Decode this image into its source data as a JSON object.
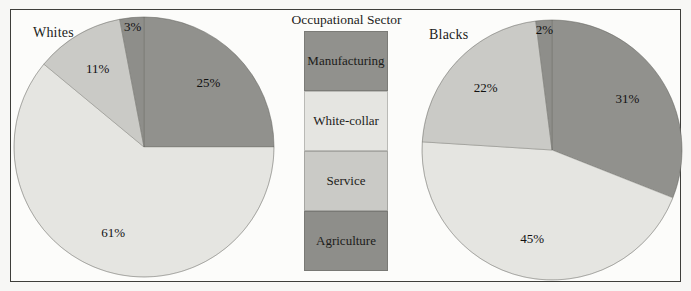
{
  "legend": {
    "title": "Occupational Sector",
    "items": [
      {
        "label": "Manufacturing",
        "color": "#91918d"
      },
      {
        "label": "White-collar",
        "color": "#e5e5e1"
      },
      {
        "label": "Service",
        "color": "#cacac6"
      },
      {
        "label": "Agriculture",
        "color": "#8e8e8a"
      }
    ]
  },
  "chart_data": [
    {
      "type": "pie",
      "title": "Whites",
      "categories": [
        "Manufacturing",
        "White-collar",
        "Service",
        "Agriculture"
      ],
      "values": [
        25,
        61,
        11,
        3
      ],
      "labels": [
        "25%",
        "61%",
        "11%",
        "3%"
      ],
      "start_angle_deg": 0,
      "direction": "clockwise",
      "legend_title": "Occupational Sector"
    },
    {
      "type": "pie",
      "title": "Blacks",
      "categories": [
        "Manufacturing",
        "White-collar",
        "Service",
        "Agriculture"
      ],
      "values": [
        31,
        45,
        22,
        2
      ],
      "labels": [
        "31%",
        "45%",
        "22%",
        "2%"
      ],
      "start_angle_deg": 0,
      "direction": "clockwise",
      "legend_title": "Occupational Sector"
    }
  ],
  "style": {
    "slice_stroke": "#61615d",
    "background": "#fcfcfa"
  }
}
